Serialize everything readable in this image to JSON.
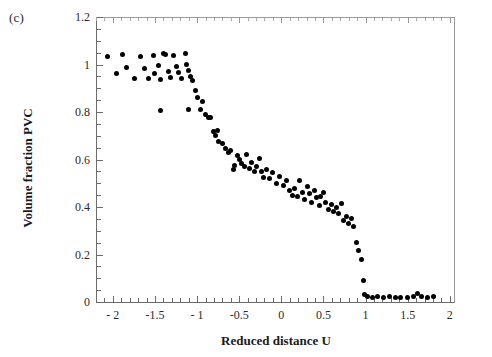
{
  "figure": {
    "panel_label": "(c)"
  },
  "chart_data": {
    "type": "scatter",
    "title": "",
    "panel": "(c)",
    "xlabel": "Reduced distance U",
    "ylabel": "Volume fraction PVC",
    "xlim": [
      -2.2,
      2.05
    ],
    "ylim": [
      0,
      1.2
    ],
    "grid": false,
    "legend": false,
    "marker": {
      "shape": "circle",
      "color": "#000000",
      "size": 5
    },
    "xticks": [
      -2,
      -1.5,
      -1,
      -0.5,
      0,
      0.5,
      1,
      1.5,
      2
    ],
    "xtick_labels": [
      "- 2",
      "-1.5",
      "- 1",
      "-0.5",
      "0",
      "0.5",
      "1",
      "1.5",
      "2"
    ],
    "x_minor_tick_step": 0.1,
    "yticks": [
      0,
      0.2,
      0.4,
      0.6,
      0.8,
      1,
      1.2
    ],
    "ytick_labels": [
      "0",
      "0.2",
      "0.4",
      "0.6",
      "0.8",
      "1",
      "1.2"
    ],
    "y_minor_tick_step": 0.05,
    "series": [
      {
        "name": "Volume fraction PVC vs reduced distance U",
        "points": [
          [
            -2.06,
            1.035
          ],
          [
            -1.96,
            0.963
          ],
          [
            -1.88,
            1.042
          ],
          [
            -1.84,
            0.988
          ],
          [
            -1.74,
            0.94
          ],
          [
            -1.67,
            1.032
          ],
          [
            -1.63,
            0.985
          ],
          [
            -1.58,
            0.942
          ],
          [
            -1.52,
            1.037
          ],
          [
            -1.5,
            0.962
          ],
          [
            -1.46,
            0.997
          ],
          [
            -1.44,
            0.938
          ],
          [
            -1.4,
            1.048
          ],
          [
            -1.37,
            1.041
          ],
          [
            -1.34,
            0.97
          ],
          [
            -1.31,
            0.945
          ],
          [
            -1.28,
            1.036
          ],
          [
            -1.25,
            0.992
          ],
          [
            -1.22,
            0.966
          ],
          [
            -1.19,
            0.943
          ],
          [
            -1.14,
            1.046
          ],
          [
            -1.12,
            1.0
          ],
          [
            -1.1,
            0.975
          ],
          [
            -1.08,
            0.948
          ],
          [
            -1.06,
            0.932
          ],
          [
            -1.44,
            0.805
          ],
          [
            -1.02,
            0.89
          ],
          [
            -0.99,
            0.863
          ],
          [
            -0.96,
            0.812
          ],
          [
            -1.1,
            0.81
          ],
          [
            -0.93,
            0.845
          ],
          [
            -0.9,
            0.79
          ],
          [
            -0.87,
            0.775
          ],
          [
            -0.84,
            0.777
          ],
          [
            -0.8,
            0.718
          ],
          [
            -0.78,
            0.7
          ],
          [
            -0.76,
            0.722
          ],
          [
            -0.74,
            0.675
          ],
          [
            -0.7,
            0.668
          ],
          [
            -0.66,
            0.648
          ],
          [
            -0.63,
            0.63
          ],
          [
            -0.6,
            0.637
          ],
          [
            -0.56,
            0.575
          ],
          [
            -0.52,
            0.618
          ],
          [
            -0.5,
            0.6
          ],
          [
            -0.47,
            0.585
          ],
          [
            -0.44,
            0.57
          ],
          [
            -0.41,
            0.62
          ],
          [
            -0.57,
            0.56
          ],
          [
            -0.38,
            0.563
          ],
          [
            -0.35,
            0.588
          ],
          [
            -0.32,
            0.548
          ],
          [
            -0.29,
            0.572
          ],
          [
            -0.26,
            0.605
          ],
          [
            -0.24,
            0.548
          ],
          [
            -0.21,
            0.523
          ],
          [
            -0.18,
            0.56
          ],
          [
            -0.14,
            0.52
          ],
          [
            -0.1,
            0.545
          ],
          [
            -0.06,
            0.5
          ],
          [
            -0.02,
            0.527
          ],
          [
            0.02,
            0.49
          ],
          [
            0.06,
            0.51
          ],
          [
            0.1,
            0.47
          ],
          [
            0.13,
            0.45
          ],
          [
            0.16,
            0.48
          ],
          [
            0.19,
            0.445
          ],
          [
            0.22,
            0.512
          ],
          [
            0.25,
            0.462
          ],
          [
            0.28,
            0.43
          ],
          [
            0.31,
            0.487
          ],
          [
            0.33,
            0.455
          ],
          [
            0.36,
            0.42
          ],
          [
            0.39,
            0.47
          ],
          [
            0.42,
            0.44
          ],
          [
            0.45,
            0.408
          ],
          [
            0.47,
            0.445
          ],
          [
            0.5,
            0.462
          ],
          [
            0.53,
            0.418
          ],
          [
            0.56,
            0.39
          ],
          [
            0.59,
            0.412
          ],
          [
            0.62,
            0.383
          ],
          [
            0.65,
            0.4
          ],
          [
            0.68,
            0.372
          ],
          [
            0.71,
            0.415
          ],
          [
            0.74,
            0.345
          ],
          [
            0.77,
            0.362
          ],
          [
            0.8,
            0.33
          ],
          [
            0.83,
            0.352
          ],
          [
            0.86,
            0.318
          ],
          [
            0.89,
            0.252
          ],
          [
            0.92,
            0.215
          ],
          [
            0.95,
            0.18
          ],
          [
            0.97,
            0.09
          ],
          [
            0.99,
            0.03
          ],
          [
            1.02,
            0.022
          ],
          [
            1.08,
            0.02
          ],
          [
            1.14,
            0.022
          ],
          [
            1.21,
            0.02
          ],
          [
            1.28,
            0.022
          ],
          [
            1.35,
            0.02
          ],
          [
            1.42,
            0.021
          ],
          [
            1.5,
            0.02
          ],
          [
            1.57,
            0.023
          ],
          [
            1.62,
            0.035
          ],
          [
            1.66,
            0.022
          ],
          [
            1.74,
            0.021
          ],
          [
            1.81,
            0.022
          ]
        ]
      }
    ]
  }
}
